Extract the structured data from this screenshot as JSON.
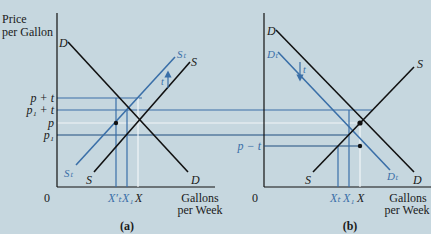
{
  "colors": {
    "background": "#c6d7df",
    "black_curve": "#111111",
    "blue_curve": "#3a6fa8",
    "white_line": "#f2f6f8"
  },
  "axes": {
    "y_title_line1": "Price",
    "y_title_line2": "per Gallon",
    "x_title_line1": "Gallons",
    "x_title_line2": "per Week",
    "origin": "0"
  },
  "panel_a": {
    "caption": "(a)",
    "price_labels": [
      "p + t",
      "p₁ + t",
      "p",
      "p₁"
    ],
    "quantity_labels": [
      "X′ₜ",
      "X₁",
      "X"
    ],
    "curves": {
      "demand": "D",
      "demand_bottom": "D",
      "supply": "S",
      "supply_bottom": "S",
      "taxed_supply": "Sₜ",
      "taxed_supply_bottom": "Sₜ"
    },
    "shift_label": "t"
  },
  "panel_b": {
    "caption": "(b)",
    "price_labels": [
      "p − t"
    ],
    "quantity_labels": [
      "Xₜ",
      "X₁",
      "X"
    ],
    "curves": {
      "demand": "D",
      "demand_bottom": "D",
      "supply": "S",
      "supply_top": "S",
      "taxed_demand": "Dₜ",
      "taxed_demand_bottom": "Dₜ"
    },
    "shift_label": "t"
  }
}
